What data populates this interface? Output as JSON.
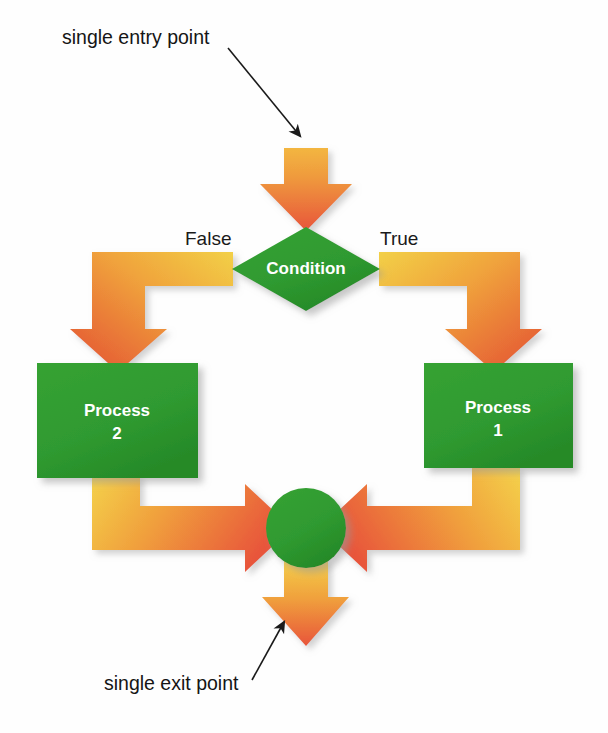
{
  "diagram": {
    "background_color": "#fefefe"
  },
  "palette": {
    "green_node": "#2f9a30",
    "green_node_dark": "#248222",
    "arrow_yellow": "#f5cf45",
    "arrow_orange": "#f0a03a",
    "arrow_red": "#e8553a",
    "text_dark": "#151515",
    "node_text": "#ffffff",
    "shadow": "#bdbdbd"
  },
  "callouts": [
    {
      "id": "entry",
      "text": "single entry point",
      "x": 62,
      "y": 44,
      "leader": {
        "x1": 228,
        "y1": 48,
        "x2": 300,
        "y2": 136
      }
    },
    {
      "id": "exit",
      "text": "single exit point",
      "x": 104,
      "y": 690,
      "leader": {
        "x1": 252,
        "y1": 680,
        "x2": 282,
        "y2": 624
      }
    }
  ],
  "nodes": [
    {
      "id": "condition",
      "type": "decision",
      "label": "Condition",
      "shape": "diamond",
      "cx": 306,
      "cy": 269,
      "rx": 74,
      "ry": 42
    },
    {
      "id": "process-2",
      "type": "process",
      "label_line1": "Process",
      "label_line2": "2",
      "shape": "rectangle",
      "x": 37,
      "y": 363,
      "width": 161,
      "height": 115
    },
    {
      "id": "process-1",
      "type": "process",
      "label_line1": "Process",
      "label_line2": "1",
      "shape": "rectangle",
      "x": 424,
      "y": 363,
      "width": 149,
      "height": 105
    },
    {
      "id": "merge",
      "type": "connector",
      "label": "",
      "shape": "circle",
      "cx": 306,
      "cy": 528,
      "r": 40
    }
  ],
  "branch_labels": [
    {
      "id": "false",
      "text": "False",
      "x": 185,
      "y": 245
    },
    {
      "id": "true",
      "text": "True",
      "x": 380,
      "y": 245
    }
  ],
  "edges": [
    {
      "id": "entry-to-condition",
      "from": "start",
      "to": "condition",
      "direction": "down",
      "style": "straight-arrow"
    },
    {
      "id": "condition-false",
      "from": "condition",
      "to": "process-2",
      "direction": "left-then-down",
      "style": "elbow-arrow",
      "label": "False"
    },
    {
      "id": "condition-true",
      "from": "condition",
      "to": "process-1",
      "direction": "right-then-down",
      "style": "elbow-arrow",
      "label": "True"
    },
    {
      "id": "process2-to-merge",
      "from": "process-2",
      "to": "merge",
      "direction": "down-then-right",
      "style": "elbow-arrow"
    },
    {
      "id": "process1-to-merge",
      "from": "process-1",
      "to": "merge",
      "direction": "down-then-left",
      "style": "elbow-arrow"
    },
    {
      "id": "merge-to-exit",
      "from": "merge",
      "to": "end",
      "direction": "down",
      "style": "straight-arrow"
    }
  ]
}
